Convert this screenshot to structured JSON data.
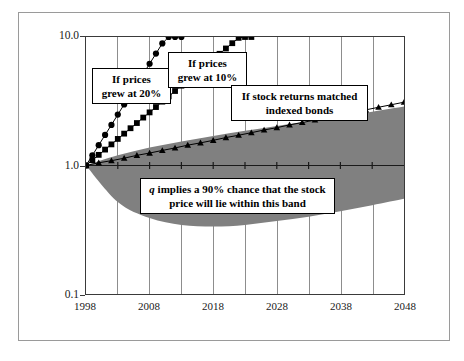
{
  "chart_data": {
    "type": "line",
    "title": "",
    "xlabel": "",
    "ylabel": "Ratios to end-1998 Values",
    "yscale": "log",
    "ylim": [
      0.1,
      10.0
    ],
    "xlim": [
      1998,
      2048
    ],
    "y_ticklabels": [
      "10.0",
      "1.0",
      "0.1"
    ],
    "y_tickvalues": [
      10.0,
      1.0,
      0.1
    ],
    "x_ticklabels": [
      "1998",
      "2008",
      "2018",
      "2028",
      "2038",
      "2048"
    ],
    "x_tickvalues": [
      1998,
      2008,
      2018,
      2028,
      2038,
      2048
    ],
    "gridlines": {
      "x_every_years": 5,
      "y": false
    },
    "legend": "none",
    "annotations": [
      {
        "id": "prices-20",
        "text_line1": "If prices",
        "text_line2": "grew at 20%"
      },
      {
        "id": "prices-10",
        "text_line1": "If prices",
        "text_line2": "grew at 10%"
      },
      {
        "id": "indexed-bonds",
        "text_line1": "If stock returns matched",
        "text_line2": "indexed bonds"
      },
      {
        "id": "band-note",
        "text_line1_pre": "q",
        "text_line1_post": " implies a 90% chance that the stock",
        "text_line2": "price will lie within this band"
      }
    ],
    "series": [
      {
        "name": "If prices grew at 20%",
        "marker": "circle",
        "growth_rate_pct": 20,
        "x": [
          1998,
          1999,
          2000,
          2001,
          2002,
          2003,
          2004,
          2005,
          2006,
          2007,
          2008,
          2009,
          2010,
          2011,
          2012,
          2013
        ],
        "values": [
          1.0,
          1.2,
          1.44,
          1.73,
          2.07,
          2.49,
          2.99,
          3.58,
          4.3,
          5.16,
          6.19,
          7.43,
          8.92,
          10.0,
          10.0,
          10.0
        ]
      },
      {
        "name": "If prices grew at 10%",
        "marker": "square",
        "growth_rate_pct": 10,
        "x": [
          1998,
          1999,
          2000,
          2001,
          2002,
          2003,
          2004,
          2005,
          2006,
          2007,
          2008,
          2009,
          2010,
          2011,
          2012,
          2013,
          2014,
          2015,
          2016,
          2017,
          2018,
          2019,
          2020,
          2021,
          2022,
          2023,
          2024
        ],
        "values": [
          1.0,
          1.1,
          1.21,
          1.33,
          1.46,
          1.61,
          1.77,
          1.95,
          2.14,
          2.36,
          2.59,
          2.85,
          3.14,
          3.45,
          3.8,
          4.18,
          4.59,
          5.05,
          5.56,
          6.12,
          6.73,
          7.4,
          8.14,
          8.95,
          9.85,
          10.0,
          10.0
        ]
      },
      {
        "name": "If stock returns matched indexed bonds",
        "marker": "triangle",
        "growth_rate_pct": 2.3,
        "x": [
          1998,
          2000,
          2002,
          2004,
          2006,
          2008,
          2010,
          2012,
          2014,
          2016,
          2018,
          2020,
          2022,
          2024,
          2026,
          2028,
          2030,
          2032,
          2034,
          2036,
          2038,
          2040,
          2042,
          2044,
          2046,
          2048
        ],
        "values": [
          1.0,
          1.05,
          1.09,
          1.14,
          1.2,
          1.25,
          1.31,
          1.37,
          1.44,
          1.5,
          1.57,
          1.65,
          1.72,
          1.8,
          1.89,
          1.97,
          2.07,
          2.16,
          2.26,
          2.37,
          2.48,
          2.59,
          2.71,
          2.84,
          2.97,
          3.11
        ]
      }
    ],
    "band": {
      "name": "90% confidence band",
      "fill_color": "#808080",
      "x": [
        1998,
        2003,
        2008,
        2013,
        2018,
        2023,
        2028,
        2033,
        2038,
        2043,
        2048
      ],
      "upper": [
        1.0,
        1.2,
        1.38,
        1.54,
        1.7,
        1.86,
        2.03,
        2.21,
        2.4,
        2.62,
        2.88
      ],
      "lower": [
        1.0,
        0.52,
        0.39,
        0.345,
        0.335,
        0.345,
        0.37,
        0.4,
        0.44,
        0.49,
        0.55
      ]
    }
  },
  "colors": {
    "band_gray": "#808080",
    "axis": "#3a3a3a",
    "grid": "#8d8d8d",
    "marker": "#000000",
    "frame": "#9a9a9a"
  }
}
